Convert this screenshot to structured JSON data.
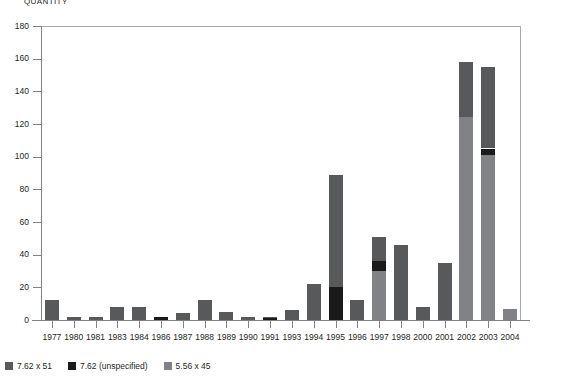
{
  "chart_data": {
    "type": "bar",
    "title": "QUANTITY",
    "subtitle": "",
    "xlabel": "",
    "ylabel": "QUANTITY",
    "stacked": true,
    "grid": false,
    "legend_position": "bottom-left",
    "ylim": [
      0,
      180
    ],
    "yticks": [
      0,
      20,
      40,
      60,
      80,
      100,
      120,
      140,
      160,
      180
    ],
    "ytick_labels": [
      "0",
      "20",
      "40",
      "60",
      "80",
      "100",
      "120",
      "140",
      "160",
      "180"
    ],
    "categories": [
      "1977",
      "1980",
      "1981",
      "1983",
      "1984",
      "1986",
      "1987",
      "1988",
      "1989",
      "1990",
      "1991",
      "1993",
      "1994",
      "1995",
      "1996",
      "1997",
      "1998",
      "2000",
      "2001",
      "2002",
      "2003",
      "2004"
    ],
    "series": [
      {
        "name": "5.56 x 45",
        "color": "#808285",
        "values": [
          0,
          0,
          0,
          0,
          0,
          0,
          0,
          0,
          0,
          0,
          0,
          0,
          0,
          0,
          0,
          30,
          0,
          0,
          0,
          124,
          101,
          7
        ]
      },
      {
        "name": "7.62 (unspecified)",
        "color": "#1a1a1a",
        "values": [
          0,
          0,
          0,
          0,
          0,
          2,
          0,
          0,
          0,
          0,
          1,
          0,
          0,
          20,
          0,
          6,
          0,
          0,
          0,
          0,
          4,
          0
        ]
      },
      {
        "name": "7.62 x 51",
        "color": "#58595b",
        "values": [
          12,
          2,
          2,
          8,
          8,
          0,
          4,
          12,
          5,
          2,
          1,
          6,
          22,
          69,
          12,
          15,
          46,
          8,
          35,
          34,
          50,
          0
        ]
      }
    ],
    "totals": [
      12,
      2,
      2,
      8,
      8,
      2,
      4,
      12,
      5,
      2,
      2,
      6,
      22,
      89,
      12,
      51,
      46,
      8,
      35,
      158,
      155,
      7
    ]
  },
  "legend": {
    "items": [
      {
        "label": "7.62 x 51",
        "color": "#58595b"
      },
      {
        "label": "7.62 (unspecified)",
        "color": "#1a1a1a"
      },
      {
        "label": "5.56 x 45",
        "color": "#808285"
      }
    ]
  }
}
